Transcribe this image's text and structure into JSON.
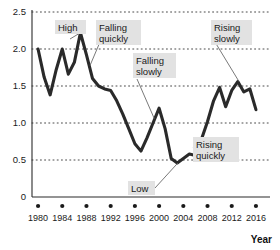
{
  "chart_data": {
    "type": "line",
    "title": "",
    "xlabel": "Year",
    "ylabel": "",
    "xlim": [
      1979,
      2017
    ],
    "ylim": [
      0,
      2.5
    ],
    "grid": true,
    "legend": "none",
    "xticks": [
      "1980",
      "1984",
      "1988",
      "1992",
      "1996",
      "2000",
      "2004",
      "2008",
      "2012",
      "2016"
    ],
    "xtick_values": [
      1980,
      1984,
      1988,
      1992,
      1996,
      2000,
      2004,
      2008,
      2012,
      2016
    ],
    "yticks": [
      "0",
      "0.5",
      "1.0",
      "1.5",
      "2.0",
      "2.5"
    ],
    "ytick_values": [
      0,
      0.5,
      1.0,
      1.5,
      2.0,
      2.5
    ],
    "series": [
      {
        "name": "value",
        "color": "#2a2a2a",
        "x": [
          1980,
          1981,
          1982,
          1983,
          1984,
          1985,
          1986,
          1987,
          1988,
          1989,
          1990,
          1991,
          1992,
          1993,
          1994,
          1995,
          1996,
          1997,
          1998,
          1999,
          2000,
          2001,
          2002,
          2003,
          2004,
          2005,
          2006,
          2007,
          2008,
          2009,
          2010,
          2011,
          2012,
          2013,
          2014,
          2015,
          2016
        ],
        "values": [
          2.0,
          1.62,
          1.38,
          1.72,
          2.0,
          1.66,
          1.82,
          2.22,
          1.92,
          1.6,
          1.5,
          1.46,
          1.44,
          1.3,
          1.12,
          0.92,
          0.72,
          0.62,
          0.8,
          1.0,
          1.2,
          0.92,
          0.52,
          0.46,
          0.52,
          0.58,
          0.56,
          0.78,
          1.02,
          1.3,
          1.48,
          1.22,
          1.44,
          1.56,
          1.42,
          1.46,
          1.18
        ]
      }
    ],
    "annotations": [
      {
        "id": "high",
        "label": "High",
        "label_line2": "",
        "point_x": 1987,
        "point_y": 2.22
      },
      {
        "id": "falling-quickly",
        "label": "Falling",
        "label_line2": "quickly",
        "point_x": 1988.6,
        "point_y": 1.78
      },
      {
        "id": "falling-slowly",
        "label": "Falling",
        "label_line2": "slowly",
        "point_x": 1999.2,
        "point_y": 1.06
      },
      {
        "id": "rising-slowly",
        "label": "Rising",
        "label_line2": "slowly",
        "point_x": 2013.2,
        "point_y": 1.56
      },
      {
        "id": "rising-quickly",
        "label": "Rising",
        "label_line2": "quickly",
        "point_x": 2007.0,
        "point_y": 0.8
      },
      {
        "id": "low",
        "label": "Low",
        "label_line2": "",
        "point_x": 2003.1,
        "point_y": 0.46
      }
    ]
  }
}
